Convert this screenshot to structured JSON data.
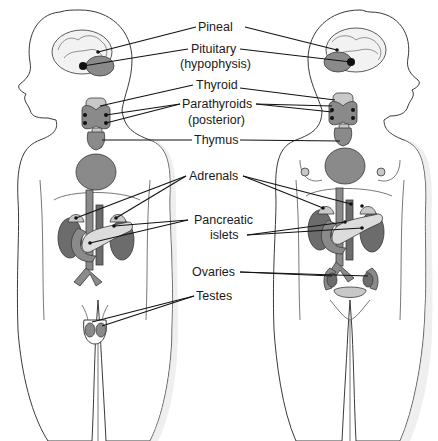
{
  "figure": {
    "type": "anatomical-diagram",
    "figures": [
      "male",
      "female"
    ],
    "colors": {
      "outline": "#3a3a3a",
      "organ_dark": "#6c6c6c",
      "organ_mid": "#8a8a8a",
      "organ_light": "#c8c8c8",
      "leader_line": "#111111",
      "background": "#ffffff"
    }
  },
  "labels": {
    "pineal": "Pineal",
    "pituitary": "Pituitary",
    "pituitary_alt": "(hypophysis)",
    "thyroid": "Thyroid",
    "parathyroids": "Parathyroids",
    "parathyroids_note": "(posterior)",
    "thymus": "Thymus",
    "adrenals": "Adrenals",
    "pancreatic_line1": "Pancreatic",
    "pancreatic_line2": "islets",
    "ovaries": "Ovaries",
    "testes": "Testes"
  }
}
